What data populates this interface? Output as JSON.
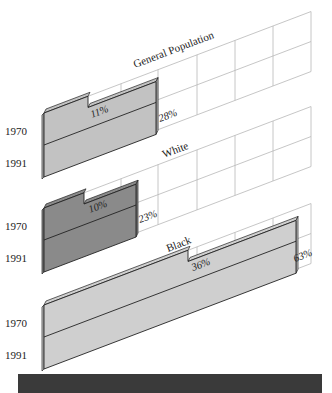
{
  "chart_data": {
    "type": "bar",
    "style": "3d-skewed-horizontal-bars",
    "categories": [
      "1970",
      "1991"
    ],
    "panels": [
      {
        "title": "General Population",
        "values": {
          "1970": 11,
          "1991": 28
        },
        "labels": [
          "11%",
          "28%"
        ],
        "color": "#c2c2c2"
      },
      {
        "title": "White",
        "values": {
          "1970": 10,
          "1991": 23
        },
        "labels": [
          "10%",
          "23%"
        ],
        "color": "#8a8a8a"
      },
      {
        "title": "Black",
        "values": {
          "1970": 36,
          "1991": 63
        },
        "labels": [
          "36%",
          "63%"
        ],
        "color": "#cfcfcf"
      }
    ],
    "xlabel": "",
    "ylabel": "",
    "grid": true,
    "legend": "none"
  },
  "labels": {
    "general": {
      "title": "General Population",
      "y1970": "1970",
      "y1991": "1991",
      "v1970": "11%",
      "v1991": "28%"
    },
    "white": {
      "title": "White",
      "y1970": "1970",
      "y1991": "1991",
      "v1970": "10%",
      "v1991": "23%"
    },
    "black": {
      "title": "Black",
      "y1970": "1970",
      "y1991": "1991",
      "v1970": "36%",
      "v1991": "63%"
    }
  },
  "colors": {
    "general_bar": "#c2c2c2",
    "white_bar": "#8a8a8a",
    "black_bar": "#cfcfcf",
    "footer_bar": "#3a3a3a"
  }
}
